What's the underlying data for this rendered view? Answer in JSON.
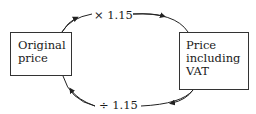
{
  "diagram": {
    "nodes": [
      {
        "id": "original",
        "lines": [
          "Original",
          "price"
        ]
      },
      {
        "id": "vat",
        "lines": [
          "Price",
          "including",
          "VAT"
        ]
      }
    ],
    "edges": [
      {
        "from": "original",
        "to": "vat",
        "label": "× 1.15"
      },
      {
        "from": "vat",
        "to": "original",
        "label": "÷ 1.15"
      }
    ]
  }
}
